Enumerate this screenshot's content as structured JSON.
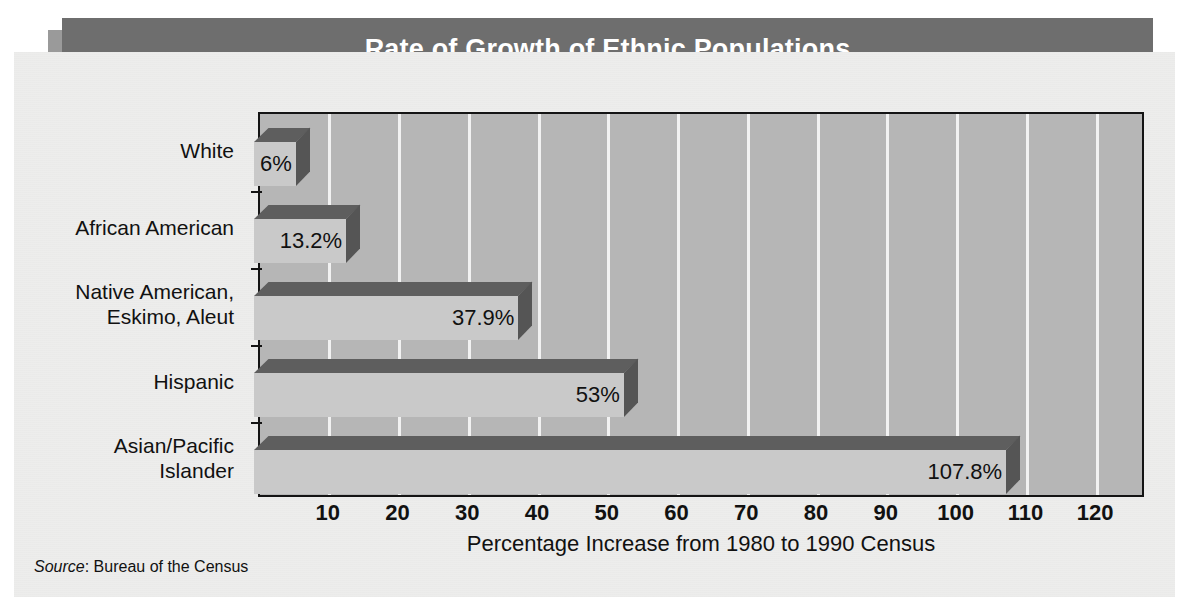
{
  "title": "Rate of Growth of Ethnic Populations",
  "source_label": "Source",
  "source_text": ": Bureau of the Census",
  "colors": {
    "page_background": "#ffffff",
    "panel_background": "#ededec",
    "banner": "#6e6e6e",
    "banner_shadow": "#9a9a9a",
    "banner_text": "#ffffff",
    "plot_background": "#b6b6b6",
    "gridline": "#f2f2f2",
    "axis": "#141414",
    "bar_front": "#c9c9c9",
    "bar_top": "#5e5e5e",
    "bar_side": "#555555",
    "text": "#111111"
  },
  "chart_data": {
    "type": "bar",
    "orientation": "horizontal",
    "title": "Rate of Growth of Ethnic Populations",
    "xlabel": "Percentage Increase from 1980 to 1990 Census",
    "ylabel": "",
    "xlim": [
      0,
      127
    ],
    "xticks": [
      10,
      20,
      30,
      40,
      50,
      60,
      70,
      80,
      90,
      100,
      110,
      120
    ],
    "xtick_labels": [
      "10",
      "20",
      "30",
      "40",
      "50",
      "60",
      "70",
      "80",
      "90",
      "100",
      "110",
      "120"
    ],
    "grid": "vertical",
    "legend": "none",
    "style_3d": true,
    "categories": [
      "White",
      "African American",
      "Native American,\nEskimo, Aleut",
      "Hispanic",
      "Asian/Pacific\nIslander"
    ],
    "values": [
      6,
      13.2,
      37.9,
      53,
      107.8
    ],
    "value_labels": [
      "6%",
      "13.2%",
      "37.9%",
      "53%",
      "107.8%"
    ],
    "bars": [
      {
        "category": "White",
        "value": 6,
        "label": "6%"
      },
      {
        "category": "African American",
        "value": 13.2,
        "label": "13.2%"
      },
      {
        "category": "Native American,\nEskimo, Aleut",
        "value": 37.9,
        "label": "37.9%"
      },
      {
        "category": "Hispanic",
        "value": 53,
        "label": "53%"
      },
      {
        "category": "Asian/Pacific\nIslander",
        "value": 107.8,
        "label": "107.8%"
      }
    ],
    "source": "Source: Bureau of the Census"
  }
}
